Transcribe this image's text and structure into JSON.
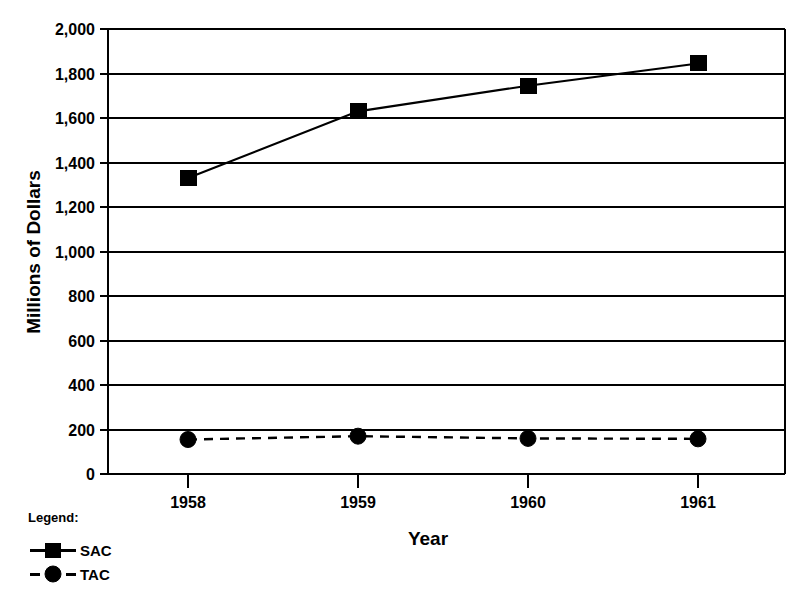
{
  "chart_data": {
    "type": "line",
    "title": "",
    "xlabel": "Year",
    "ylabel": "Millions of Dollars",
    "categories": [
      "1958",
      "1959",
      "1960",
      "1961"
    ],
    "x": [
      1958,
      1959,
      1960,
      1961
    ],
    "xlim": [
      1957.5,
      1961.5
    ],
    "ylim": [
      0,
      2000
    ],
    "y_ticks": [
      0,
      200,
      400,
      600,
      800,
      1000,
      1200,
      1400,
      1600,
      1800,
      2000
    ],
    "y_tick_labels": [
      "0",
      "200",
      "400",
      "600",
      "800",
      "1,000",
      "1,200",
      "1,400",
      "1,600",
      "1,800",
      "2,000"
    ],
    "grid": "horizontal",
    "legend_position": "below-left",
    "legend_title": "Legend:",
    "series": [
      {
        "name": "SAC",
        "values": [
          1330,
          1630,
          1745,
          1845
        ],
        "marker": "square",
        "line_style": "solid",
        "color": "#000000"
      },
      {
        "name": "TAC",
        "values": [
          155,
          170,
          160,
          158
        ],
        "marker": "circle",
        "line_style": "dashed",
        "color": "#000000"
      }
    ]
  },
  "axes": {
    "y_title": "Millions of Dollars",
    "x_title": "Year"
  },
  "legend": {
    "title": "Legend:",
    "entries": [
      {
        "label": "SAC",
        "marker": "square-marker",
        "line": "solid-line"
      },
      {
        "label": "TAC",
        "marker": "circle-marker",
        "line": "dashed-line"
      }
    ]
  },
  "y_tick_labels": {
    "t0": "0",
    "t1": "200",
    "t2": "400",
    "t3": "600",
    "t4": "800",
    "t5": "1,000",
    "t6": "1,200",
    "t7": "1,400",
    "t8": "1,600",
    "t9": "1,800",
    "t10": "2,000"
  },
  "x_tick_labels": {
    "t0": "1958",
    "t1": "1959",
    "t2": "1960",
    "t3": "1961"
  },
  "colors": {
    "ink": "#000000",
    "background": "#ffffff"
  }
}
